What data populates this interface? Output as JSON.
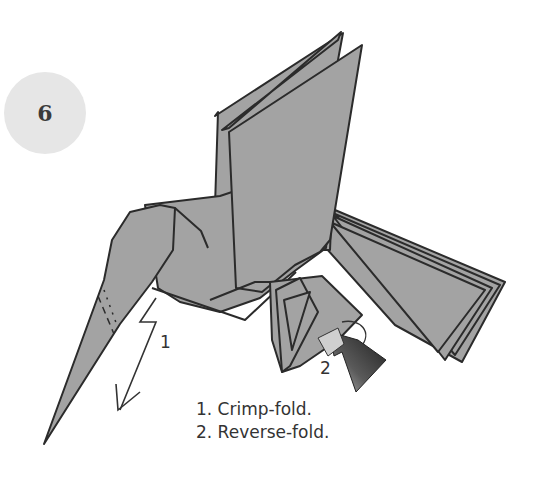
{
  "step": {
    "number": "6"
  },
  "labels": {
    "arrow1": "1",
    "arrow2": "2"
  },
  "instructions": [
    {
      "text": "1. Crimp-fold."
    },
    {
      "text": "2. Reverse-fold."
    }
  ],
  "colors": {
    "paper": "#a3a3a3",
    "outline": "#2b2b2b",
    "badge": "#e6e6e6",
    "arrow_dark": "#3a3a3a",
    "arrow_light": "#c8c8c8"
  }
}
